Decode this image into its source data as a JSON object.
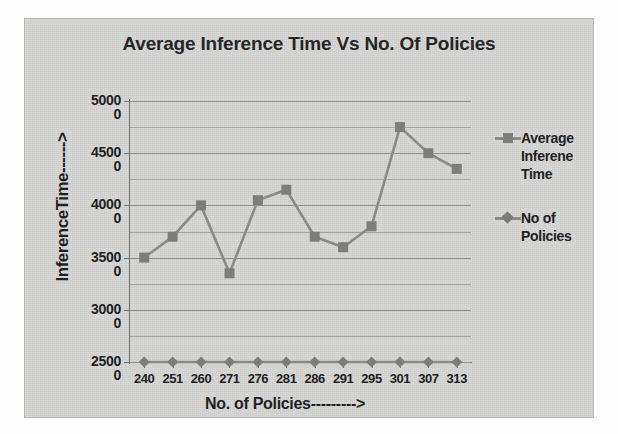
{
  "chart_data": {
    "type": "line",
    "title": "Average Inference Time Vs No. Of Policies",
    "xlabel": "No. of Policies--------->",
    "ylabel": "InferenceTime------>",
    "categories": [
      "240",
      "251",
      "260",
      "271",
      "276",
      "281",
      "286",
      "291",
      "295",
      "301",
      "307",
      "313"
    ],
    "ytick_labels": [
      "50000",
      "45000",
      "40000",
      "35000",
      "30000",
      "25000"
    ],
    "ytick_values": [
      50000,
      45000,
      40000,
      35000,
      30000,
      25000
    ],
    "ylim": [
      25000,
      50000
    ],
    "grid": true,
    "minor_gridlines": true,
    "legend_position": "right",
    "series": [
      {
        "name": "Average Inferene Time",
        "marker": "square",
        "color": "#7d7d7b",
        "values": [
          35000,
          37000,
          40000,
          33500,
          40500,
          41500,
          37000,
          36000,
          38000,
          47500,
          45000,
          43500
        ]
      },
      {
        "name": "No of Policies",
        "marker": "diamond",
        "color": "#7d7d7b",
        "values": [
          240,
          251,
          260,
          271,
          276,
          281,
          286,
          291,
          295,
          301,
          307,
          313
        ]
      }
    ]
  },
  "legend": {
    "entries": [
      {
        "label_line1": "Average",
        "label_line2": "Inferene",
        "label_line3": "Time",
        "marker": "square"
      },
      {
        "label_line1": "No of",
        "label_line2": "Policies",
        "label_line3": "",
        "marker": "diamond"
      }
    ]
  },
  "colors": {
    "panel_background": "#d4d4d2",
    "series_line": "#8a8a88",
    "marker": "#7d7d7b",
    "gridline": "#8d8d8b",
    "axis": "#6f6f6d",
    "text": "#1f1f1f"
  }
}
